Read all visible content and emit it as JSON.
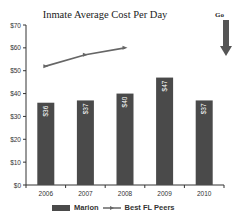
{
  "chart_data": {
    "type": "bar",
    "title": "Inmate Average Cost Per Day",
    "xlabel": "",
    "ylabel": "",
    "ylim": [
      0,
      70
    ],
    "yticks": [
      "$0",
      "$10",
      "$20",
      "$30",
      "$40",
      "$50",
      "$60",
      "$70"
    ],
    "categories": [
      "2006",
      "2007",
      "2008",
      "2009",
      "2010"
    ],
    "series": [
      {
        "name": "Marion",
        "kind": "bar",
        "values": [
          36,
          37,
          40,
          47,
          37
        ],
        "labels": [
          "$36",
          "$37",
          "$40",
          "$47",
          "$37"
        ],
        "color": "#4a4a4a"
      },
      {
        "name": "Best FL Peers",
        "kind": "line",
        "values": [
          52,
          57,
          60,
          null,
          null
        ],
        "color": "#666666"
      }
    ],
    "grid": false,
    "legend_position": "bottom"
  },
  "annotation": {
    "label": "Go",
    "arrow": "down-arrow"
  }
}
